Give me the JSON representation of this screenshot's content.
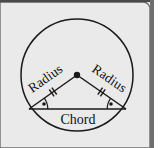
{
  "figure": {
    "kind": "geometry-diagram",
    "title_visible": false,
    "background_color": "#eaeaea",
    "page_color": "#ffffff",
    "border_color": "#555555",
    "ink_color": "#1a1a1a",
    "labels": {
      "radius_left": "Radius",
      "radius_right": "Radius",
      "chord": "Chord"
    },
    "shapes": {
      "circle": {
        "cx": 77,
        "cy": 75,
        "r": 56
      },
      "center_point": {
        "cx": 77,
        "cy": 75,
        "r": 3.2
      },
      "chord": {
        "x1": 29,
        "y1": 109,
        "x2": 126,
        "y2": 109
      },
      "radius_left_segment": {
        "x1": 77,
        "y1": 75,
        "x2": 29,
        "y2": 109
      },
      "radius_right_segment": {
        "x1": 77,
        "y1": 75,
        "x2": 126,
        "y2": 109
      }
    },
    "markers": {
      "congruence_ticks": 2,
      "angle_arcs": 2,
      "angle_dots": 2
    },
    "label_rotation": {
      "radius_left_deg": -35,
      "radius_right_deg": 35,
      "chord_deg": 0
    }
  }
}
